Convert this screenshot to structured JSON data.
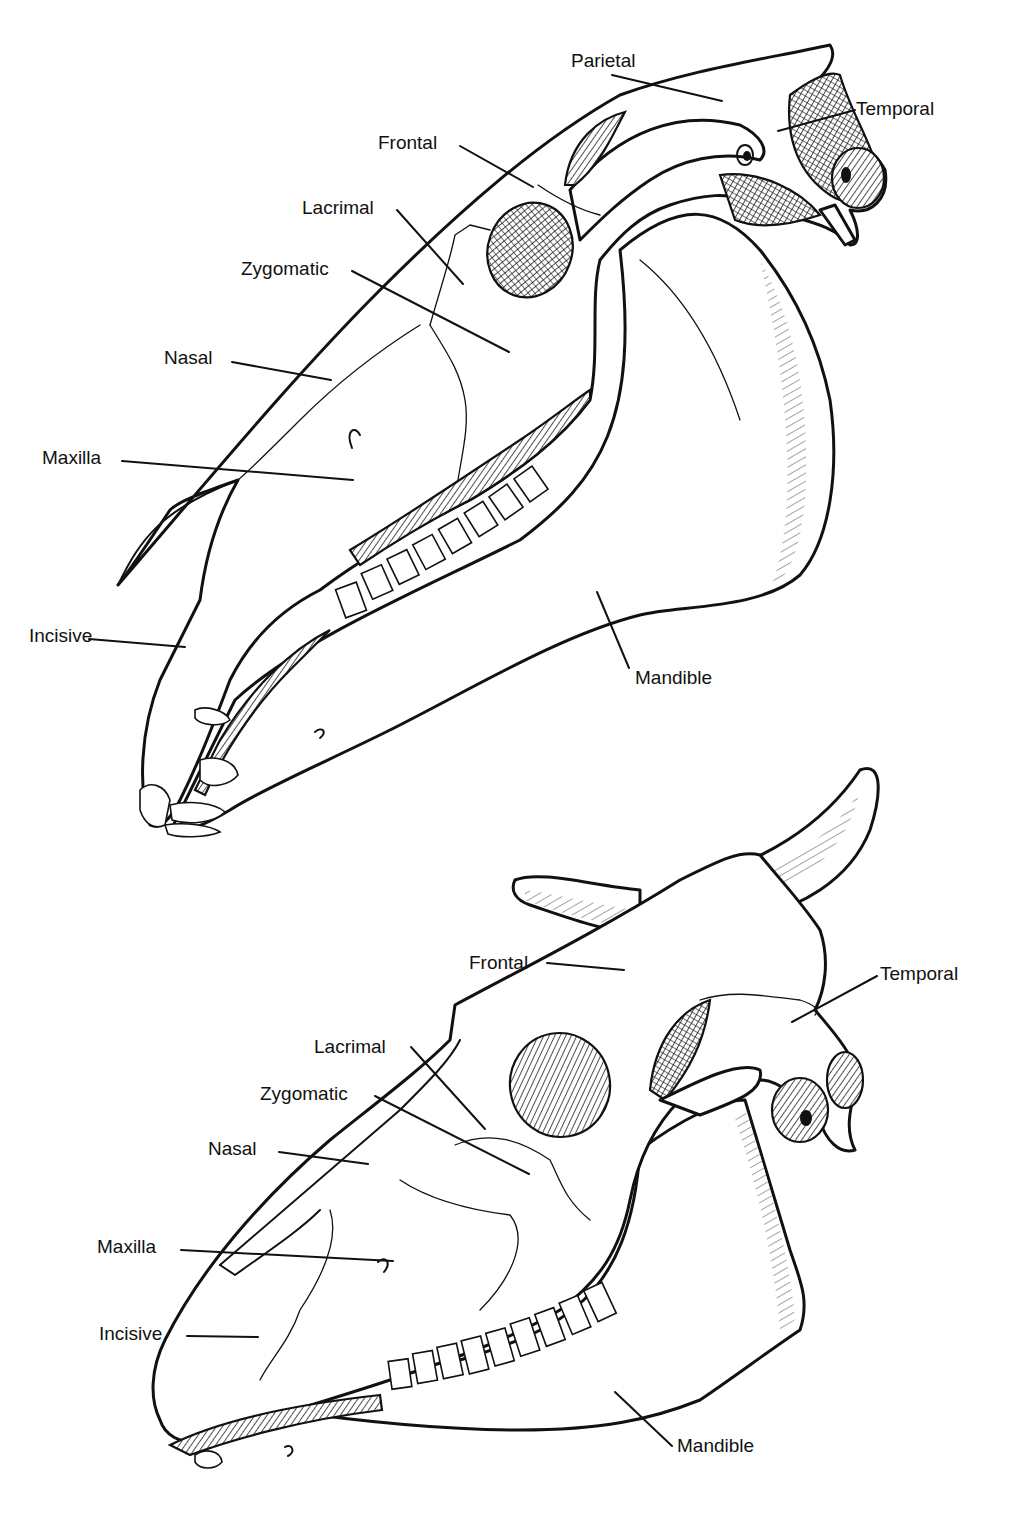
{
  "figure": {
    "background": "#ffffff",
    "ink_color": "#111111",
    "skulls": [
      {
        "id": "horse",
        "subject": "Horse skull, lateral view",
        "labels": [
          {
            "key": "parietal",
            "text": "Parietal",
            "x": 571,
            "y": 51,
            "line": [
              612,
              75,
              722,
              101
            ]
          },
          {
            "key": "temporal",
            "text": "Temporal",
            "x": 856,
            "y": 99,
            "line": [
              855,
              110,
              778,
              131
            ]
          },
          {
            "key": "frontal",
            "text": "Frontal",
            "x": 378,
            "y": 133,
            "line": [
              460,
              146,
              533,
              187
            ]
          },
          {
            "key": "lacrimal",
            "text": "Lacrimal",
            "x": 302,
            "y": 198,
            "line": [
              397,
              210,
              463,
              284
            ]
          },
          {
            "key": "zygomatic",
            "text": "Zygomatic",
            "x": 241,
            "y": 259,
            "line": [
              352,
              271,
              509,
              352
            ]
          },
          {
            "key": "nasal",
            "text": "Nasal",
            "x": 164,
            "y": 348,
            "line": [
              232,
              362,
              331,
              380
            ]
          },
          {
            "key": "maxilla",
            "text": "Maxilla",
            "x": 42,
            "y": 448,
            "line": [
              122,
              461,
              353,
              480
            ]
          },
          {
            "key": "incisive",
            "text": "Incisive",
            "x": 29,
            "y": 626,
            "line": [
              89,
              639,
              185,
              647
            ]
          },
          {
            "key": "mandible",
            "text": "Mandible",
            "x": 635,
            "y": 668,
            "line": [
              629,
              668,
              597,
              592
            ]
          }
        ]
      },
      {
        "id": "ox",
        "subject": "Ox skull, lateral view",
        "labels": [
          {
            "key": "frontal",
            "text": "Frontal",
            "x": 469,
            "y": 953,
            "line": [
              547,
              963,
              624,
              970
            ]
          },
          {
            "key": "temporal",
            "text": "Temporal",
            "x": 880,
            "y": 964,
            "line": [
              877,
              976,
              792,
              1022
            ]
          },
          {
            "key": "lacrimal",
            "text": "Lacrimal",
            "x": 314,
            "y": 1037,
            "line": [
              411,
              1047,
              485,
              1129
            ]
          },
          {
            "key": "zygomatic",
            "text": "Zygomatic",
            "x": 260,
            "y": 1084,
            "line": [
              375,
              1096,
              529,
              1174
            ]
          },
          {
            "key": "nasal",
            "text": "Nasal",
            "x": 208,
            "y": 1139,
            "line": [
              279,
              1152,
              368,
              1164
            ]
          },
          {
            "key": "maxilla",
            "text": "Maxilla",
            "x": 97,
            "y": 1237,
            "line": [
              181,
              1250,
              393,
              1261
            ]
          },
          {
            "key": "incisive",
            "text": "Incisive",
            "x": 99,
            "y": 1324,
            "line": [
              187,
              1336,
              258,
              1337
            ]
          },
          {
            "key": "mandible",
            "text": "Mandible",
            "x": 677,
            "y": 1436,
            "line": [
              672,
              1446,
              615,
              1392
            ]
          }
        ]
      }
    ]
  }
}
